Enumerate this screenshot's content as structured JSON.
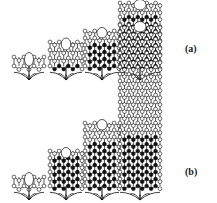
{
  "figure": {
    "width": 217,
    "height": 203,
    "background_color": "#ffffff",
    "ink_color": "#111111",
    "atom_fill_light": "#ffffff",
    "atom_fill_dark": "#111111"
  },
  "rows": [
    {
      "id": "row-a",
      "label": "(a)",
      "label_x": 185,
      "label_y": 43,
      "baseline_y": 80,
      "structures": [
        {
          "id": "a1",
          "x": 14,
          "baseline_y": 80,
          "tube_width": 30,
          "rings": 1,
          "ring_height": 9,
          "dark_ratio": 0.0,
          "root_height": 14,
          "cap_open": true
        },
        {
          "id": "a2",
          "x": 50,
          "baseline_y": 80,
          "tube_width": 32,
          "rings": 3,
          "ring_height": 8,
          "dark_ratio": 0.45,
          "root_height": 14,
          "cap_open": true
        },
        {
          "id": "a3",
          "x": 85,
          "baseline_y": 80,
          "tube_width": 34,
          "rings": 5,
          "ring_height": 7,
          "dark_ratio": 0.7,
          "root_height": 14,
          "cap_open": true
        },
        {
          "id": "a4",
          "x": 120,
          "baseline_y": 80,
          "tube_width": 40,
          "rings": 9,
          "ring_height": 7,
          "dark_ratio": 0.85,
          "root_height": 14,
          "cap_open": true
        }
      ]
    },
    {
      "id": "row-b",
      "label": "(b)",
      "label_x": 185,
      "label_y": 166,
      "baseline_y": 200,
      "structures": [
        {
          "id": "b1",
          "x": 14,
          "baseline_y": 200,
          "tube_width": 30,
          "rings": 1,
          "ring_height": 9,
          "dark_ratio": 0.0,
          "root_height": 14,
          "cap_open": true
        },
        {
          "id": "b2",
          "x": 50,
          "baseline_y": 200,
          "tube_width": 32,
          "rings": 5,
          "ring_height": 7,
          "dark_ratio": 0.9,
          "root_height": 14,
          "cap_open": true
        },
        {
          "id": "b3",
          "x": 85,
          "baseline_y": 200,
          "tube_width": 34,
          "rings": 9,
          "ring_height": 7,
          "dark_ratio": 0.75,
          "root_height": 14,
          "cap_open": true
        },
        {
          "id": "b4",
          "x": 120,
          "baseline_y": 200,
          "tube_width": 40,
          "rings": 23,
          "ring_height": 7,
          "dark_ratio": 0.35,
          "root_height": 14,
          "cap_open": true
        }
      ]
    }
  ]
}
